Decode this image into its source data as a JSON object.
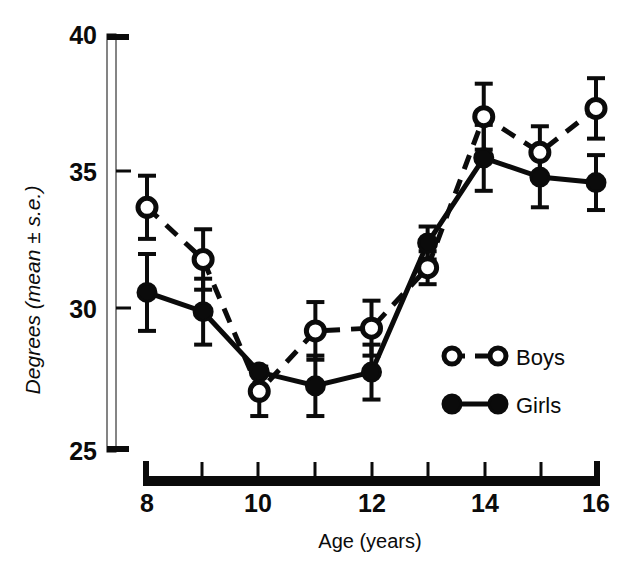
{
  "chart_data": {
    "type": "line",
    "title": "",
    "subtitle": "",
    "xlabel": "Age (years)",
    "ylabel": "Degrees (mean ± s.e.)",
    "xlim": [
      8,
      16
    ],
    "ylim": [
      25,
      40
    ],
    "x": [
      8,
      9,
      10,
      11,
      12,
      13,
      14,
      15,
      16
    ],
    "xticks": [
      8,
      9,
      10,
      11,
      12,
      13,
      14,
      15,
      16
    ],
    "xtick_labels": [
      "8",
      "",
      "10",
      "",
      "12",
      "",
      "14",
      "",
      "16"
    ],
    "yticks": [
      25,
      30,
      35,
      40
    ],
    "ytick_labels": [
      "25",
      "30",
      "35",
      "40"
    ],
    "grid": false,
    "legend_position": "inside-lower-right",
    "error_bar_type": "standard error of the mean",
    "series": [
      {
        "name": "Boys",
        "marker": "open-circle",
        "linestyle": "dashed",
        "color": "#0b0b0b",
        "values": [
          33.8,
          31.9,
          27.1,
          29.3,
          29.4,
          31.6,
          37.1,
          35.8,
          37.4
        ],
        "errors": [
          1.15,
          1.1,
          0.9,
          1.05,
          1.0,
          0.6,
          1.2,
          0.95,
          1.1
        ]
      },
      {
        "name": "Girls",
        "marker": "filled-circle",
        "linestyle": "solid",
        "color": "#0b0b0b",
        "values": [
          30.7,
          30.0,
          27.8,
          27.3,
          27.8,
          32.5,
          35.6,
          34.9,
          34.7
        ],
        "errors": [
          1.4,
          1.2,
          0.0,
          1.1,
          1.0,
          0.6,
          1.2,
          1.1,
          1.0
        ]
      }
    ]
  },
  "legend": {
    "entries": [
      {
        "label": "Boys",
        "marker": "open-circle",
        "linestyle": "dashed"
      },
      {
        "label": "Girls",
        "marker": "filled-circle",
        "linestyle": "solid"
      }
    ]
  },
  "colors": {
    "ink": "#0b0b0b",
    "background": "#ffffff"
  }
}
